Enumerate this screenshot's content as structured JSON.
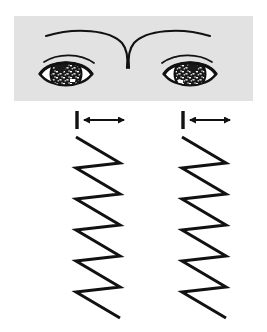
{
  "figure": {
    "background_color": "#ffffff",
    "width": 267,
    "height": 332
  },
  "eye_panel": {
    "name": "eyes-photo-panel",
    "background_color": "#e2e2e2",
    "ink_color": "#111111",
    "x": 14,
    "y": 16,
    "width": 239,
    "height": 85,
    "eyes": [
      {
        "label": "left-eye",
        "side": "left",
        "center_x": 66,
        "center_y": 74,
        "iris_fill": "#1a1a1a",
        "sclera_fill": "#ffffff",
        "iris_texture": "speckled"
      },
      {
        "label": "right-eye",
        "side": "right",
        "center_x": 190,
        "center_y": 74,
        "iris_fill": "#1a1a1a",
        "sclera_fill": "#ffffff",
        "iris_texture": "speckled"
      }
    ]
  },
  "markers": [
    {
      "name": "amplitude-marker-left",
      "bar_x": 77,
      "arrow_from_x": 82,
      "arrow_to_x": 126,
      "y": 120,
      "color": "#111111"
    },
    {
      "name": "amplitude-marker-right",
      "bar_x": 183,
      "arrow_from_x": 188,
      "arrow_to_x": 232,
      "y": 120,
      "color": "#111111"
    }
  ],
  "chart_data": {
    "type": "line",
    "title": "",
    "xlabel": "",
    "ylabel": "",
    "orientation": "vertical-time-axis",
    "grid": false,
    "legend": null,
    "stroke_color": "#111111",
    "stroke_width": 3,
    "xlim": [
      0,
      44
    ],
    "ylim": [
      0,
      190
    ],
    "traces": [
      {
        "name": "left-eye-nystagmus-trace",
        "origin_x": 76,
        "origin_y": 36,
        "amplitude": 44,
        "cycles": 6,
        "cycle_height": 31,
        "waveform": "sawtooth",
        "points": [
          [
            0,
            0
          ],
          [
            44,
            26
          ],
          [
            0,
            31
          ],
          [
            44,
            57
          ],
          [
            0,
            62
          ],
          [
            44,
            88
          ],
          [
            0,
            93
          ],
          [
            44,
            119
          ],
          [
            0,
            124
          ],
          [
            44,
            150
          ],
          [
            0,
            155
          ],
          [
            44,
            181
          ]
        ]
      },
      {
        "name": "right-eye-nystagmus-trace",
        "origin_x": 182,
        "origin_y": 36,
        "amplitude": 44,
        "cycles": 6,
        "cycle_height": 31,
        "waveform": "sawtooth",
        "points": [
          [
            0,
            0
          ],
          [
            44,
            26
          ],
          [
            0,
            31
          ],
          [
            44,
            57
          ],
          [
            0,
            62
          ],
          [
            44,
            88
          ],
          [
            0,
            93
          ],
          [
            44,
            119
          ],
          [
            0,
            124
          ],
          [
            44,
            150
          ],
          [
            0,
            155
          ],
          [
            44,
            181
          ]
        ]
      }
    ]
  }
}
